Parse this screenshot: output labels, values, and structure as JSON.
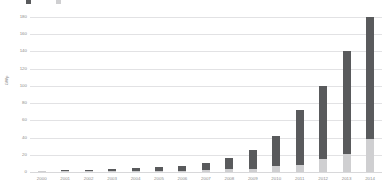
{
  "chart_data": {
    "type": "bar",
    "subtype": "stacked-bar",
    "title": "",
    "xlabel": "",
    "ylabel": "GWp",
    "ylim": [
      0,
      180
    ],
    "ytick_labels": [
      "0",
      "20",
      "40",
      "60",
      "80",
      "100",
      "120",
      "140",
      "160",
      "180"
    ],
    "ytick_values": [
      0,
      20,
      40,
      60,
      80,
      100,
      120,
      140,
      160,
      180
    ],
    "grid": true,
    "legend_position": "top-left",
    "categories": [
      "2000",
      "2001",
      "2002",
      "2003",
      "2004",
      "2005",
      "2006",
      "2007",
      "2008",
      "2009",
      "2010",
      "2011",
      "2012",
      "2013",
      "2014"
    ],
    "series": [
      {
        "name": "Cumulative installed capacity (previous years)",
        "color": "#595a5c",
        "values": [
          1.0,
          1.5,
          2.0,
          2.7,
          3.5,
          4.5,
          5.5,
          7.5,
          13.5,
          21.0,
          35.0,
          64.0,
          85.0,
          119.0,
          142.0
        ]
      },
      {
        "name": "Newly installed capacity",
        "color": "#cfcfd1",
        "values": [
          0.3,
          0.4,
          0.5,
          0.6,
          0.9,
          1.3,
          1.5,
          2.5,
          3.0,
          4.0,
          7.0,
          8.0,
          15.0,
          21.0,
          38.0
        ]
      }
    ],
    "totals": [
      1.3,
      1.9,
      2.5,
      3.3,
      4.4,
      5.8,
      7.0,
      10.0,
      16.5,
      25.0,
      42.0,
      72.0,
      100.0,
      140.0,
      180.0
    ]
  },
  "legend": {
    "entries": [
      {
        "label": "",
        "color": "#595a5c",
        "icon": "legend-swatch-dark"
      },
      {
        "label": "",
        "color": "#cfcfd1",
        "icon": "legend-swatch-light"
      }
    ]
  },
  "axes": {
    "y_title": "GWp"
  }
}
